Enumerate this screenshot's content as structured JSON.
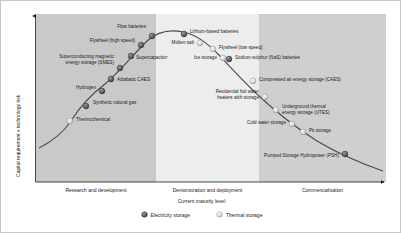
{
  "chart_data": {
    "type": "scatter",
    "title": "",
    "xlabel": "Current maturity level",
    "ylabel": "Capital requirement x technology risk",
    "grid": false,
    "legend_position": "bottom-center",
    "x_axis": {
      "type": "categorical-phases",
      "phases": [
        {
          "label": "Research and development",
          "start": 35,
          "end": 155
        },
        {
          "label": "Demonstration and deployment",
          "start": 155,
          "end": 258
        },
        {
          "label": "Commercialisation",
          "start": 258,
          "end": 385
        }
      ]
    },
    "legend": [
      {
        "label": "Electricity storage",
        "marker": "dark-sphere",
        "color": "#595959"
      },
      {
        "label": "Thermal storage",
        "marker": "light-sphere",
        "color": "#d0d0d0"
      }
    ],
    "series": [
      {
        "name": "Electricity storage",
        "marker": "dark-sphere",
        "points": [
          {
            "label": "Synthetic natural gas",
            "x": 85,
            "y": 105,
            "label_x": 92,
            "label_y": 102,
            "align": "right"
          },
          {
            "label": "Hydrogen",
            "x": 101,
            "y": 90,
            "label_x": 97,
            "label_y": 87,
            "align": "left"
          },
          {
            "label": "Adiabatic CAES",
            "x": 110,
            "y": 78,
            "label_x": 116,
            "label_y": 79,
            "align": "right"
          },
          {
            "label": "Superconducting magnetic\nenergy storage (SMES)",
            "x": 119,
            "y": 67,
            "label_x": 115,
            "label_y": 56,
            "align": "left"
          },
          {
            "label": "Supercapacitor",
            "x": 130,
            "y": 55,
            "label_x": 135,
            "label_y": 57,
            "align": "right"
          },
          {
            "label": "Flywheel (high speed)",
            "x": 140,
            "y": 44,
            "label_x": 136,
            "label_y": 40,
            "align": "left"
          },
          {
            "label": "Flow batteries",
            "x": 151,
            "y": 35,
            "label_x": 147,
            "label_y": 26,
            "align": "left"
          },
          {
            "label": "Lithium-based batteries",
            "x": 183,
            "y": 33,
            "label_x": 189,
            "label_y": 31,
            "align": "right"
          },
          {
            "label": "Sodium-sulphur (NaS) batteries",
            "x": 228,
            "y": 58,
            "label_x": 234,
            "label_y": 57,
            "align": "right"
          },
          {
            "label": "Pumped Storage Hydropower (PSH)",
            "x": 344,
            "y": 153,
            "label_x": 340,
            "label_y": 155,
            "align": "left"
          }
        ]
      },
      {
        "name": "Thermal storage",
        "marker": "light-sphere",
        "points": [
          {
            "label": "Thermochemical",
            "x": 69,
            "y": 120,
            "label_x": 75,
            "label_y": 119,
            "align": "right"
          },
          {
            "label": "Molten salt",
            "x": 199,
            "y": 42,
            "label_x": 195,
            "label_y": 42,
            "align": "left"
          },
          {
            "label": "Flywheel (low speed)",
            "x": 212,
            "y": 48,
            "label_x": 218,
            "label_y": 47,
            "align": "right"
          },
          {
            "label": "Ice storage",
            "x": 222,
            "y": 57,
            "label_x": 218,
            "label_y": 57,
            "align": "left"
          },
          {
            "label": "Compressed air energy storage (CAES)",
            "x": 252,
            "y": 80,
            "label_x": 258,
            "label_y": 79,
            "align": "right"
          },
          {
            "label": "Residential hot water\nheaters with storage",
            "x": 264,
            "y": 96,
            "label_x": 260,
            "label_y": 91,
            "align": "left"
          },
          {
            "label": "Underground thermal\nenergy storage (UTES)",
            "x": 275,
            "y": 109,
            "label_x": 281,
            "label_y": 106,
            "align": "right"
          },
          {
            "label": "Cold water storage",
            "x": 291,
            "y": 123,
            "label_x": 287,
            "label_y": 122,
            "align": "left"
          },
          {
            "label": "Pit storage",
            "x": 302,
            "y": 131,
            "label_x": 308,
            "label_y": 130,
            "align": "right"
          }
        ]
      }
    ],
    "curve_path": "M 38,147 C 52,140 62,132 70,120 C 80,104 92,92 104,83 C 118,71 132,54 146,40 C 156,31 168,28 182,31 C 196,34 206,42 218,54 C 232,69 244,82 258,95 C 274,110 294,126 316,140 C 336,152 362,163 382,170"
  },
  "figure": {
    "y_axis_label": "Capital requirement x technology risk",
    "x_axis_label": "Current maturity level"
  }
}
